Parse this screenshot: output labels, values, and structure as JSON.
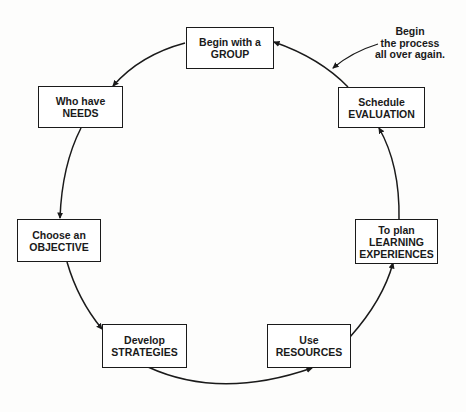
{
  "diagram": {
    "type": "cycle",
    "colors": {
      "ink": "#1a1a1a",
      "background": "#fdfdfc"
    },
    "nodes": [
      {
        "id": "group",
        "line1": "Begin with a",
        "line2": "GROUP"
      },
      {
        "id": "needs",
        "line1": "Who have",
        "line2": "NEEDS"
      },
      {
        "id": "objective",
        "line1": "Choose an",
        "line2": "OBJECTIVE"
      },
      {
        "id": "strategies",
        "line1": "Develop",
        "line2": "STRATEGIES"
      },
      {
        "id": "resources",
        "line1": "Use",
        "line2": "RESOURCES"
      },
      {
        "id": "learning",
        "line1": "To plan",
        "line2": "LEARNING",
        "line3": "EXPERIENCES"
      },
      {
        "id": "evaluation",
        "line1": "Schedule",
        "line2": "EVALUATION"
      }
    ],
    "edges": [
      {
        "from": "group",
        "to": "needs"
      },
      {
        "from": "needs",
        "to": "objective"
      },
      {
        "from": "objective",
        "to": "strategies"
      },
      {
        "from": "strategies",
        "to": "resources"
      },
      {
        "from": "resources",
        "to": "learning"
      },
      {
        "from": "learning",
        "to": "evaluation"
      },
      {
        "from": "evaluation",
        "to": "group"
      }
    ],
    "annotation": {
      "line1": "Begin",
      "line2": "the process",
      "line3": "all over again."
    }
  }
}
